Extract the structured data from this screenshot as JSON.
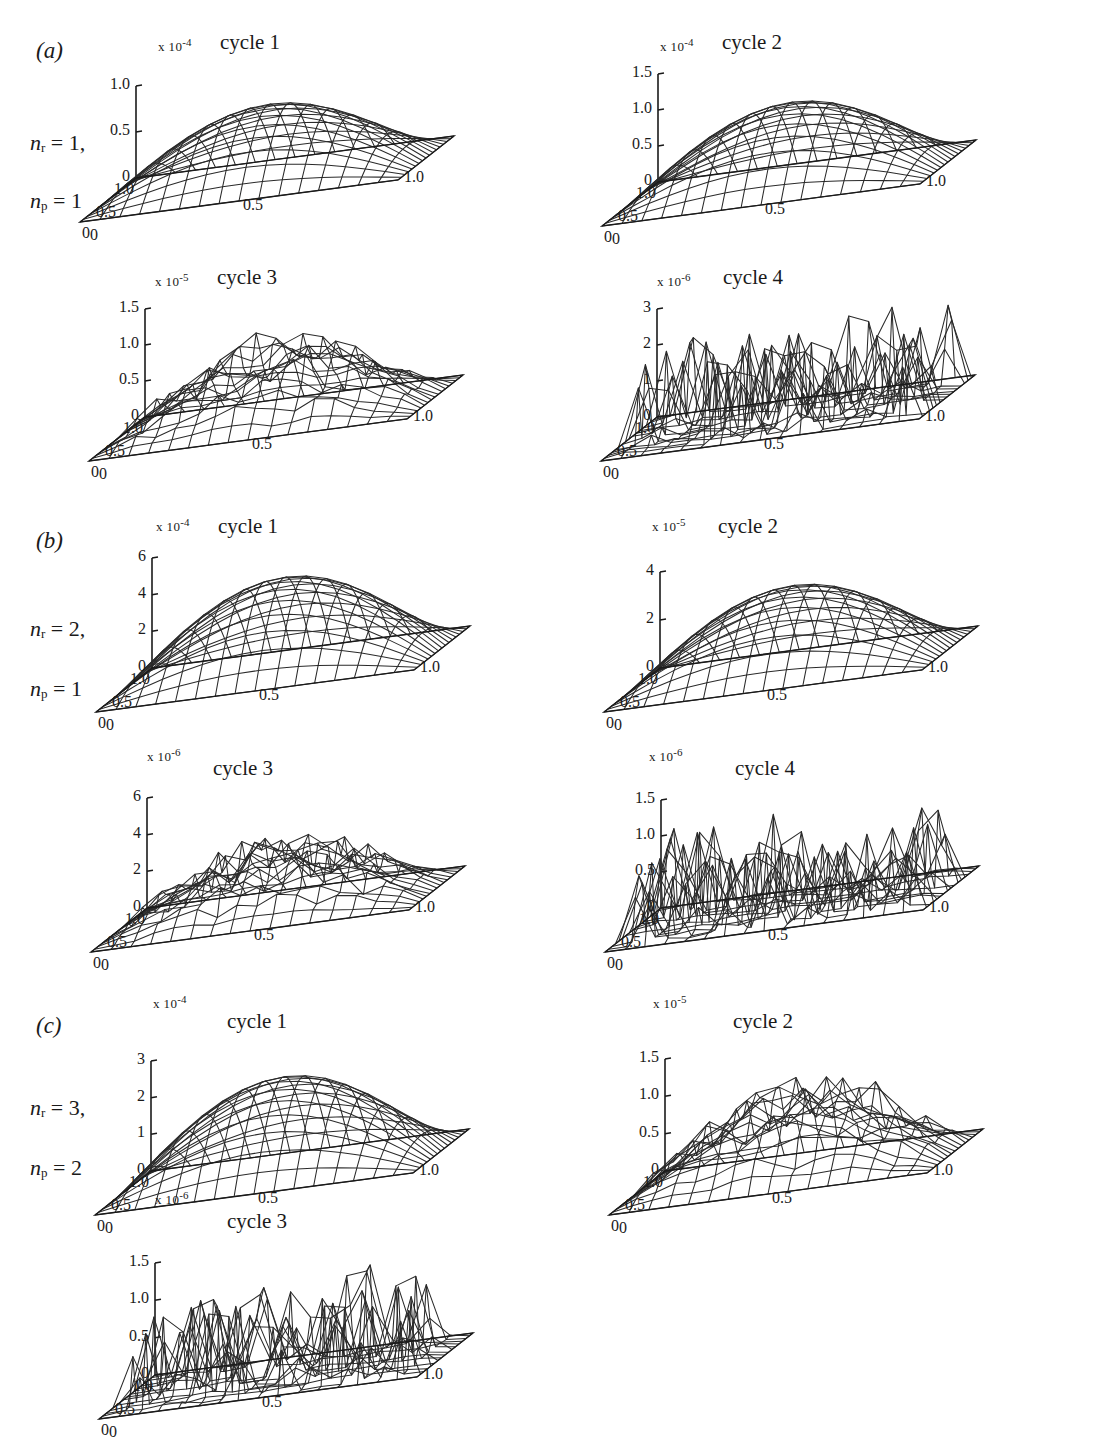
{
  "figure": {
    "background": "#ffffff",
    "ink": "#1a1a1a",
    "axis_x_left_ticks": [
      "1.0",
      "0.5",
      "0"
    ],
    "axis_x_right_ticks": [
      "0",
      "0.5",
      "1.0"
    ],
    "multiplier_prefix": "x 10",
    "rows": [
      {
        "tag": "(a)",
        "label_line1_var": "n",
        "label_line1_sub": "r",
        "label_line1_val": "= 1,",
        "label_line2_var": "n",
        "label_line2_sub": "p",
        "label_line2_val": "= 1"
      },
      {
        "tag": "(b)",
        "label_line1_var": "n",
        "label_line1_sub": "r",
        "label_line1_val": "= 2,",
        "label_line2_var": "n",
        "label_line2_sub": "p",
        "label_line2_val": "= 1"
      },
      {
        "tag": "(c)",
        "label_line1_var": "n",
        "label_line1_sub": "r",
        "label_line1_val": "= 3,",
        "label_line2_var": "n",
        "label_line2_sub": "p",
        "label_line2_val": "= 2"
      }
    ]
  },
  "chart_data": {
    "type": "surface",
    "shared_axes": {
      "xlabel": "",
      "ylabel": "",
      "zlabel": "",
      "x_ticks": [
        "0",
        "0.5",
        "1.0"
      ],
      "y_ticks": [
        "0",
        "0.5",
        "1.0"
      ],
      "xlim": [
        0,
        1
      ],
      "ylim": [
        0,
        1
      ],
      "grid": false,
      "legend": null,
      "projection": "3d-wireframe",
      "mesh_divisions": 16
    },
    "panels": [
      {
        "row": "(a)",
        "cycle": "cycle 1",
        "exponent": "-4",
        "z_ticks": [
          "0",
          "0.5",
          "1.0"
        ],
        "zlim": [
          0,
          1.15
        ],
        "peak": 0.92,
        "surface": "smooth-unimodal",
        "noise": 0.0
      },
      {
        "row": "(a)",
        "cycle": "cycle 2",
        "exponent": "-4",
        "z_ticks": [
          "0",
          "0.5",
          "1.0",
          "1.5"
        ],
        "zlim": [
          0,
          1.6
        ],
        "peak": 1.18,
        "surface": "smooth-unimodal",
        "noise": 0.0
      },
      {
        "row": "(a)",
        "cycle": "cycle 3",
        "exponent": "-5",
        "z_ticks": [
          "0",
          "0.5",
          "1.0",
          "1.5"
        ],
        "zlim": [
          0,
          1.6
        ],
        "peak": 1.3,
        "surface": "unimodal-with-ripple",
        "noise": 0.16
      },
      {
        "row": "(a)",
        "cycle": "cycle 4",
        "exponent": "-6",
        "z_ticks": [
          "0",
          "1",
          "2",
          "3"
        ],
        "zlim": [
          0,
          3.2
        ],
        "peak": 2.4,
        "surface": "spiky-random",
        "noise": 1.0
      },
      {
        "row": "(b)",
        "cycle": "cycle 1",
        "exponent": "-4",
        "z_ticks": [
          "0",
          "2",
          "4",
          "6"
        ],
        "zlim": [
          0,
          6.4
        ],
        "peak": 5.3,
        "surface": "smooth-unimodal",
        "noise": 0.0
      },
      {
        "row": "(b)",
        "cycle": "cycle 2",
        "exponent": "-5",
        "z_ticks": [
          "0",
          "2",
          "4"
        ],
        "zlim": [
          0,
          5.0
        ],
        "peak": 4.3,
        "surface": "smooth-unimodal",
        "noise": 0.0
      },
      {
        "row": "(b)",
        "cycle": "cycle 3",
        "exponent": "-6",
        "z_ticks": [
          "0",
          "2",
          "4",
          "6"
        ],
        "zlim": [
          0,
          6.4
        ],
        "peak": 4.2,
        "surface": "rough-unimodal",
        "noise": 0.45
      },
      {
        "row": "(b)",
        "cycle": "cycle 4",
        "exponent": "-6",
        "z_ticks": [
          "0",
          "0.5",
          "1.0",
          "1.5"
        ],
        "zlim": [
          0,
          1.6
        ],
        "peak": 1.25,
        "surface": "spiky-random",
        "noise": 1.0
      },
      {
        "row": "(c)",
        "cycle": "cycle 1",
        "exponent": "-4",
        "z_ticks": [
          "0",
          "1",
          "2",
          "3"
        ],
        "zlim": [
          0,
          3.2
        ],
        "peak": 2.75,
        "surface": "smooth-unimodal",
        "noise": 0.0
      },
      {
        "row": "(c)",
        "cycle": "cycle 2",
        "exponent": "-5",
        "z_ticks": [
          "0",
          "0.5",
          "1.0",
          "1.5"
        ],
        "zlim": [
          0,
          1.6
        ],
        "peak": 1.35,
        "surface": "unimodal-with-ripple",
        "noise": 0.2
      },
      {
        "row": "(c)",
        "cycle": "cycle 3",
        "exponent": "-6",
        "z_ticks": [
          "0",
          "0.5",
          "1.0",
          "1.5"
        ],
        "zlim": [
          0,
          1.6
        ],
        "peak": 1.2,
        "surface": "spiky-random",
        "noise": 1.0
      }
    ]
  },
  "plots": {
    "a1": {
      "exponent": "-4",
      "title": "cycle 1",
      "yticks": [
        "1.0",
        "0.5",
        "0"
      ],
      "xleft": [
        "1.0",
        "0.5",
        "0"
      ],
      "xright": [
        "0",
        "0.5",
        "1.0"
      ]
    },
    "a2": {
      "exponent": "-4",
      "title": "cycle 2",
      "yticks": [
        "1.5",
        "1.0",
        "0.5",
        "0"
      ],
      "xleft": [
        "1.0",
        "0.5",
        "0"
      ],
      "xright": [
        "0",
        "0.5",
        "1.0"
      ]
    },
    "a3": {
      "exponent": "-5",
      "title": "cycle 3",
      "yticks": [
        "1.5",
        "1.0",
        "0.5",
        "0"
      ],
      "xleft": [
        "1.0",
        "0.5",
        "0"
      ],
      "xright": [
        "0",
        "0.5",
        "1.0"
      ]
    },
    "a4": {
      "exponent": "-6",
      "title": "cycle 4",
      "yticks": [
        "3",
        "2",
        "1",
        "0"
      ],
      "xleft": [
        "1.0",
        "0.5",
        "0"
      ],
      "xright": [
        "0",
        "0.5",
        "1.0"
      ]
    },
    "b1": {
      "exponent": "-4",
      "title": "cycle 1",
      "yticks": [
        "6",
        "4",
        "2",
        "0"
      ],
      "xleft": [
        "1.0",
        "0.5",
        "0"
      ],
      "xright": [
        "0",
        "0.5",
        "1.0"
      ]
    },
    "b2": {
      "exponent": "-5",
      "title": "cycle 2",
      "yticks": [
        "4",
        "2",
        "0"
      ],
      "xleft": [
        "1.0",
        "0.5",
        "0"
      ],
      "xright": [
        "0",
        "0.5",
        "1.0"
      ]
    },
    "b3": {
      "exponent": "-6",
      "title": "cycle 3",
      "yticks": [
        "6",
        "4",
        "2",
        "0"
      ],
      "xleft": [
        "1.0",
        "0.5",
        "0"
      ],
      "xright": [
        "0",
        "0.5",
        "1.0"
      ]
    },
    "b4": {
      "exponent": "-6",
      "title": "cycle 4",
      "yticks": [
        "1.5",
        "1.0",
        "0.5",
        "0"
      ],
      "xleft": [
        "1.0",
        "0.5",
        "0"
      ],
      "xright": [
        "0",
        "0.5",
        "1.0"
      ]
    },
    "c1": {
      "exponent": "-4",
      "title": "cycle 1",
      "yticks": [
        "3",
        "2",
        "1",
        "0"
      ],
      "xleft": [
        "1.0",
        "0.5",
        "0"
      ],
      "xright": [
        "0",
        "0.5",
        "1.0"
      ]
    },
    "c2": {
      "exponent": "-5",
      "title": "cycle 2",
      "yticks": [
        "1.5",
        "1.0",
        "0.5",
        "0"
      ],
      "xleft": [
        "1.0",
        "0.5",
        "0"
      ],
      "xright": [
        "0",
        "0.5",
        "1.0"
      ]
    },
    "c3": {
      "exponent": "-6",
      "title": "cycle 3",
      "yticks": [
        "1.5",
        "1.0",
        "0.5",
        "0"
      ],
      "xleft": [
        "1.0",
        "0.5",
        "0"
      ],
      "xright": [
        "0",
        "0.5",
        "1.0"
      ]
    }
  }
}
